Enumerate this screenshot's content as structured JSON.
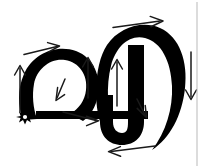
{
  "figure": {
    "kind": "stroke-order-diagram",
    "title": "Handwriting stroke order diagram",
    "canvas": {
      "width": 204,
      "height": 168
    },
    "colors": {
      "background": "#ffffff",
      "glyph": "#000000",
      "arrow": "#1a1a1a",
      "start_marker": "#000000",
      "frame_line": "#b9b9b9"
    }
  },
  "glyph": {
    "name": "letterform",
    "parts": [
      {
        "id": "omega-loop",
        "label": "omega loop",
        "stroke_width": 11
      },
      {
        "id": "baseline-bar",
        "label": "horizontal baseline bar",
        "stroke_width": 7
      },
      {
        "id": "large-oval",
        "label": "large outer oval bowl",
        "stroke_width": 13
      },
      {
        "id": "inner-hook",
        "label": "inner descending hook",
        "stroke_width": 14
      }
    ]
  },
  "markers": {
    "start": {
      "name": "start-point-star",
      "label": "start point",
      "points": 8,
      "x": 25,
      "y": 117,
      "radius": 7.5
    }
  },
  "arrows": [
    {
      "id": "a1",
      "name": "arrow-omega-left-up",
      "label": "up along omega left stem",
      "direction": "up",
      "order": 1,
      "x1": 20,
      "y1": 112,
      "x2": 20,
      "y2": 66
    },
    {
      "id": "a2",
      "name": "arrow-omega-top-right",
      "label": "right across omega top",
      "direction": "right",
      "order": 2,
      "x1": 24,
      "y1": 54,
      "x2": 58,
      "y2": 46
    },
    {
      "id": "a3",
      "name": "arrow-omega-inner-downleft",
      "label": "down-left inside omega loop",
      "direction": "down-left",
      "order": 3,
      "x1": 64,
      "y1": 80,
      "x2": 56,
      "y2": 99
    },
    {
      "id": "a4",
      "name": "arrow-baseline-right",
      "label": "right along baseline bar",
      "direction": "right",
      "order": 4,
      "x1": 63,
      "y1": 112,
      "x2": 98,
      "y2": 121
    },
    {
      "id": "a5",
      "name": "arrow-omega-right-up",
      "label": "up on omega right stem",
      "direction": "up",
      "order": 5,
      "x1": 88,
      "y1": 98,
      "x2": 88,
      "y2": 58
    },
    {
      "id": "a6",
      "name": "arrow-oval-top-right",
      "label": "right across top of oval",
      "direction": "right",
      "order": 6,
      "x1": 113,
      "y1": 27,
      "x2": 162,
      "y2": 21
    },
    {
      "id": "a7",
      "name": "arrow-inner-hook-up",
      "label": "up inside the oval",
      "direction": "up",
      "order": 7,
      "x1": 117,
      "y1": 106,
      "x2": 117,
      "y2": 60
    },
    {
      "id": "a8",
      "name": "arrow-inner-hook-downright",
      "label": "down-right on inner hook",
      "direction": "down-right",
      "order": 8,
      "x1": 138,
      "y1": 100,
      "x2": 146,
      "y2": 116
    },
    {
      "id": "a9",
      "name": "arrow-oval-right-down",
      "label": "down along right of oval",
      "direction": "down",
      "order": 9,
      "x1": 191,
      "y1": 52,
      "x2": 191,
      "y2": 100
    },
    {
      "id": "a10",
      "name": "arrow-bottom-left",
      "label": "left across bottom",
      "direction": "left",
      "order": 10,
      "x1": 155,
      "y1": 146,
      "x2": 108,
      "y2": 152
    }
  ],
  "frame": {
    "name": "right-edge-rule",
    "visible": true,
    "x": 197,
    "y1": 2,
    "y2": 166
  }
}
